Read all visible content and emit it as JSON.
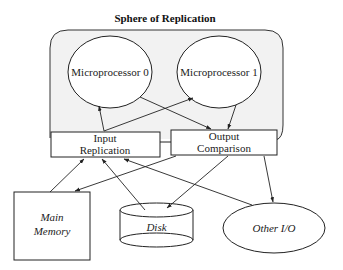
{
  "diagram": {
    "title": "Sphere of Replication",
    "nodes": {
      "cpu0": {
        "label": "Microprocessor 0",
        "shape": "ellipse"
      },
      "cpu1": {
        "label": "Microprocessor 1",
        "shape": "ellipse"
      },
      "input_replication": {
        "line1": "Input",
        "line2": "Replication",
        "shape": "rectangle"
      },
      "output_comparison": {
        "line1": "Output",
        "line2": "Comparison",
        "shape": "rectangle"
      },
      "main_memory": {
        "line1": "Main",
        "line2": "Memory",
        "shape": "rectangle"
      },
      "disk": {
        "label": "Disk",
        "shape": "cylinder"
      },
      "other_io": {
        "label": "Other I/O",
        "shape": "ellipse"
      }
    },
    "edges": [
      {
        "from": "Input Replication",
        "to": "Microprocessor 0"
      },
      {
        "from": "Input Replication",
        "to": "Microprocessor 1"
      },
      {
        "from": "Microprocessor 0",
        "to": "Output Comparison"
      },
      {
        "from": "Microprocessor 1",
        "to": "Output Comparison"
      },
      {
        "from": "Main Memory",
        "to": "Input Replication"
      },
      {
        "from": "Disk",
        "to": "Input Replication"
      },
      {
        "from": "Other I/O",
        "to": "Input Replication"
      },
      {
        "from": "Output Comparison",
        "to": "Main Memory"
      },
      {
        "from": "Output Comparison",
        "to": "Disk"
      },
      {
        "from": "Output Comparison",
        "to": "Other I/O"
      }
    ],
    "colors": {
      "sphere_fill": "#f2f2f2",
      "line": "#222222",
      "background": "#ffffff"
    }
  }
}
